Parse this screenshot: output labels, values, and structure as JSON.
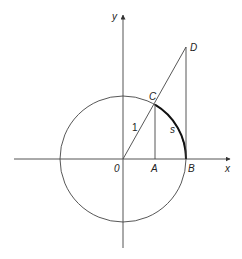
{
  "diagram": {
    "colors": {
      "line": "#444444",
      "arc_highlight": "#111111",
      "background": "#ffffff"
    },
    "axes": {
      "x_label": "x",
      "y_label": "y"
    },
    "points": {
      "origin": {
        "label": "0"
      },
      "A": {
        "label": "A"
      },
      "B": {
        "label": "B"
      },
      "C": {
        "label": "C"
      },
      "D": {
        "label": "D"
      }
    },
    "segment_labels": {
      "radius": "1",
      "arc": "s"
    }
  }
}
